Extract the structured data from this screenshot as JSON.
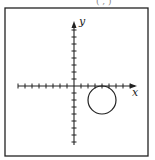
{
  "header": {
    "partial_text": "(  ,  )"
  },
  "diagram": {
    "axes": {
      "x_label": "x",
      "y_label": "y",
      "x_ticks_neg": 8,
      "x_ticks_pos": 8,
      "y_ticks_pos": 8,
      "y_ticks_neg": 8
    },
    "circle": {
      "center": [
        4,
        -2
      ],
      "radius": 2,
      "tangent_to": "x-axis"
    }
  }
}
